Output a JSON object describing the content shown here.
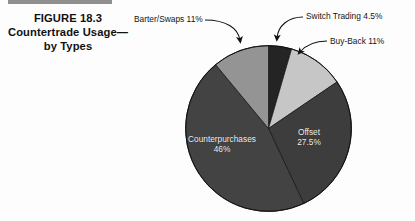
{
  "figure": {
    "title_lines": [
      "FIGURE 18.3",
      "Countertrade Usage—",
      "by Types"
    ]
  },
  "chart_data": {
    "type": "pie",
    "categories": [
      "Switch Trading",
      "Buy-Back",
      "Offset",
      "Counterpurchases",
      "Barter/Swaps"
    ],
    "values": [
      4.5,
      11,
      27.5,
      46,
      11
    ],
    "value_suffix": "%",
    "colors": [
      "#242424",
      "#c6c6c6",
      "#3d3d3d",
      "#434343",
      "#949494"
    ],
    "start_angle_deg": 0,
    "direction": "clockwise",
    "legend": "none",
    "labels": [
      {
        "key": "switch_trading",
        "name": "Switch Trading",
        "value": 4.5,
        "text": "Switch Trading 4.5%",
        "placement": "external",
        "color": "#242424"
      },
      {
        "key": "buy_back",
        "name": "Buy-Back",
        "value": 11,
        "text": "Buy-Back 11%",
        "placement": "external",
        "color": "#c6c6c6"
      },
      {
        "key": "offset",
        "name": "Offset",
        "value": 27.5,
        "text": "Offset",
        "pct_text": "27.5%",
        "placement": "internal",
        "color": "#3d3d3d"
      },
      {
        "key": "counterpurchases",
        "name": "Counterpurchases",
        "value": 46,
        "text": "Counterpurchases",
        "pct_text": "46%",
        "placement": "internal",
        "color": "#434343"
      },
      {
        "key": "barter_swaps",
        "name": "Barter/Swaps",
        "value": 11,
        "text": "Barter/Swaps 11%",
        "placement": "external",
        "color": "#949494"
      }
    ]
  }
}
